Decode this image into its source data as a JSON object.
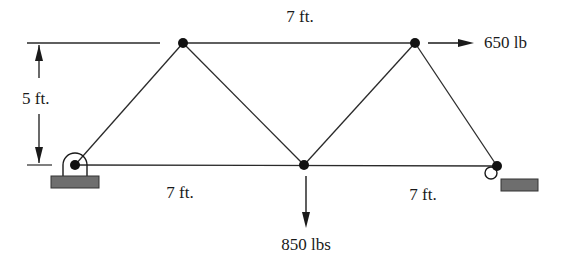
{
  "diagram": {
    "type": "truss",
    "labels": {
      "top_span": "7 ft.",
      "height": "5 ft.",
      "bottom_left_span": "7 ft.",
      "bottom_right_span": "7 ft.",
      "horizontal_load": "650 lb",
      "vertical_load": "850 lbs"
    },
    "nodes": [
      {
        "id": "A",
        "x": 75,
        "y": 165,
        "support": "pin"
      },
      {
        "id": "B",
        "x": 183,
        "y": 43
      },
      {
        "id": "C",
        "x": 304,
        "y": 165
      },
      {
        "id": "D",
        "x": 415,
        "y": 43
      },
      {
        "id": "E",
        "x": 497,
        "y": 166,
        "support": "roller"
      }
    ],
    "members": [
      [
        "A",
        "B"
      ],
      [
        "B",
        "C"
      ],
      [
        "C",
        "D"
      ],
      [
        "D",
        "E"
      ],
      [
        "B",
        "D"
      ],
      [
        "A",
        "C"
      ],
      [
        "C",
        "E"
      ]
    ],
    "loads": [
      {
        "node": "D",
        "direction": "right",
        "magnitude": "650 lb"
      },
      {
        "node": "C",
        "direction": "down",
        "magnitude": "850 lbs"
      }
    ],
    "colors": {
      "line": "#2a2a2a",
      "support_fill": "#6e6e6e"
    }
  }
}
